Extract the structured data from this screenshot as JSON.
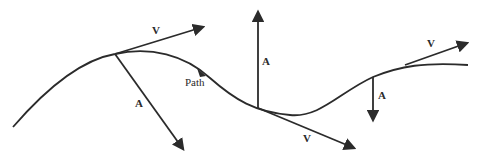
{
  "diagram": {
    "title": "",
    "colors": {
      "stroke": "#2b2b2b",
      "background": "#ffffff"
    },
    "path_label": "Path",
    "vectors": [
      {
        "id": "v1",
        "label": "V",
        "kind": "velocity"
      },
      {
        "id": "a1",
        "label": "A",
        "kind": "acceleration"
      },
      {
        "id": "a2",
        "label": "A",
        "kind": "acceleration"
      },
      {
        "id": "v2",
        "label": "V",
        "kind": "velocity"
      },
      {
        "id": "a3",
        "label": "A",
        "kind": "acceleration"
      },
      {
        "id": "v3",
        "label": "V",
        "kind": "velocity"
      }
    ]
  }
}
